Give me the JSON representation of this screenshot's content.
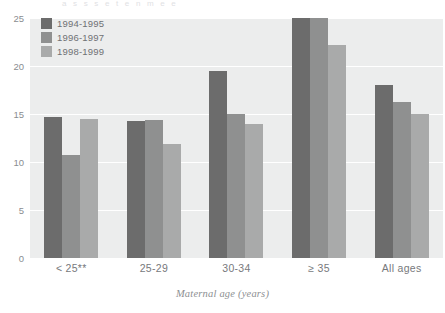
{
  "top_fragment": "a s      s    s e            t         e n         m  e  e",
  "chart_data": {
    "type": "bar",
    "title": "",
    "subtitle": "",
    "xlabel": "Maternal age (years)",
    "ylabel": "",
    "categories": [
      "< 25**",
      "25-29",
      "30-34",
      "≥ 35",
      "All ages"
    ],
    "series": [
      {
        "name": "1994-1995",
        "color": "#6c6c6c",
        "values": [
          14.7,
          14.3,
          19.5,
          25.3,
          18.0
        ]
      },
      {
        "name": "1996-1997",
        "color": "#8f9090",
        "values": [
          10.7,
          14.4,
          15.0,
          25.2,
          16.3
        ]
      },
      {
        "name": "1998-1999",
        "color": "#a9aaaa",
        "values": [
          14.5,
          11.9,
          14.0,
          22.2,
          15.0
        ]
      }
    ],
    "ylim": [
      0,
      25
    ],
    "yticks": [
      25,
      20,
      15,
      10,
      5,
      0
    ],
    "ytick_labels": [
      "25",
      "20",
      "15",
      "10",
      "5",
      "0"
    ],
    "grid": true,
    "grid_color": "#ffffff",
    "plot_background": "#eceded",
    "legend_position": "top-left"
  },
  "legend": {
    "items": [
      {
        "label": "1994-1995",
        "color": "#6c6c6c",
        "icon": "color-swatch"
      },
      {
        "label": "1996-1997",
        "color": "#8f9090",
        "icon": "color-swatch"
      },
      {
        "label": "1998-1999",
        "color": "#a9aaaa",
        "icon": "color-swatch"
      }
    ]
  }
}
